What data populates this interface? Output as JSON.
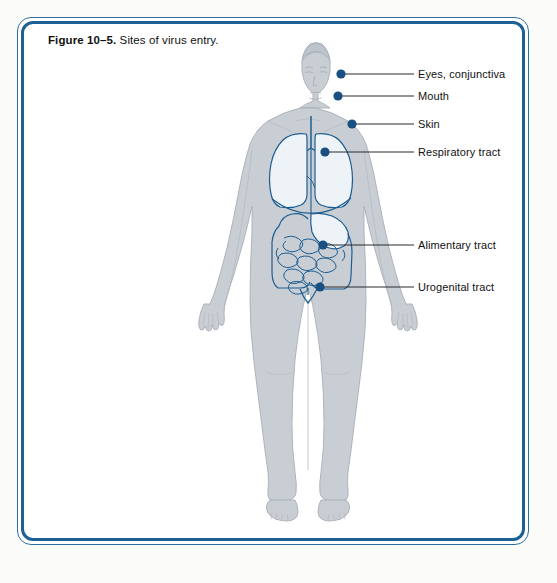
{
  "figure": {
    "caption_number": "Figure 10–5.",
    "caption_text": " Sites of virus entry.",
    "border_color_outer": "#2f6d9e",
    "border_color_inner": "#1d6095",
    "background": "#ffffff"
  },
  "diagram": {
    "body_fill": "#c9ced4",
    "body_edge": "#a8afb7",
    "organ_line_color": "#1d5d91",
    "organ_fill": "#e8eef4",
    "dot_color": "#1a4f82",
    "leader_line_color": "#2b2b2b",
    "labels": [
      {
        "id": "eyes-conjunctiva",
        "text": "Eyes, conjunctiva",
        "dot_x": 341,
        "dot_y": 74,
        "line_y": 74,
        "text_x": 418,
        "text_y": 74
      },
      {
        "id": "mouth",
        "text": "Mouth",
        "dot_x": 338,
        "dot_y": 96,
        "line_y": 96,
        "text_x": 418,
        "text_y": 96
      },
      {
        "id": "skin",
        "text": "Skin",
        "dot_x": 352,
        "dot_y": 124,
        "line_y": 124,
        "text_x": 418,
        "text_y": 124
      },
      {
        "id": "respiratory-tract",
        "text": "Respiratory tract",
        "dot_x": 325,
        "dot_y": 152,
        "line_y": 152,
        "text_x": 418,
        "text_y": 152
      },
      {
        "id": "alimentary-tract",
        "text": "Alimentary tract",
        "dot_x": 323,
        "dot_y": 245,
        "line_y": 245,
        "text_x": 418,
        "text_y": 245
      },
      {
        "id": "urogenital-tract",
        "text": "Urogenital tract",
        "dot_x": 320,
        "dot_y": 287,
        "line_y": 287,
        "text_x": 418,
        "text_y": 287
      }
    ]
  }
}
